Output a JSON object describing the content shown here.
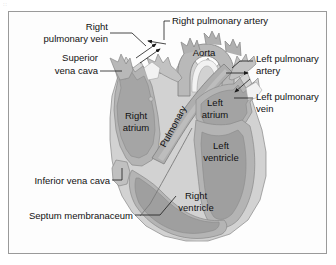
{
  "figure": {
    "corner_tag": "::",
    "frame_color": "#9a9a9a",
    "background_color": "#ffffff"
  },
  "palette": {
    "outer_myocardium": "#d2d2d2",
    "chamber_wall": "#b4b4b4",
    "chamber_lumen": "#a0a0a0",
    "vessel_light": "#c9c9c9",
    "vessel_dark": "#9c9c9c",
    "lumen_white": "#f2f2f2",
    "outline": "#6e6e6e",
    "label_text": "#111111",
    "leader_line": "#1a1a1a"
  },
  "labels": [
    {
      "id": "right-pulmonary-vein",
      "text_lines": [
        "Right",
        "pulmonary vein"
      ],
      "anchor": "end",
      "x": 108,
      "y": 36,
      "line_height": 12
    },
    {
      "id": "right-pulmonary-artery",
      "text_lines": [
        "Right pulmonary artery"
      ],
      "anchor": "start",
      "x": 172,
      "y": 24,
      "line_height": 12
    },
    {
      "id": "superior-vena-cava",
      "text_lines": [
        "Superior",
        "vena cava"
      ],
      "anchor": "end",
      "x": 98,
      "y": 67,
      "line_height": 12
    },
    {
      "id": "aorta",
      "text_lines": [
        "Aorta"
      ],
      "anchor": "middle",
      "x": 201,
      "y": 55,
      "line_height": 12
    },
    {
      "id": "left-pulmonary-artery",
      "text_lines": [
        "Left pulmonary",
        "artery"
      ],
      "anchor": "start",
      "x": 255,
      "y": 64,
      "line_height": 12
    },
    {
      "id": "left-pulmonary-vein",
      "text_lines": [
        "Left pulmonary",
        "vein"
      ],
      "anchor": "start",
      "x": 255,
      "y": 101,
      "line_height": 12
    },
    {
      "id": "left-atrium",
      "text_lines": [
        "Left",
        "atrium"
      ],
      "anchor": "middle",
      "x": 211,
      "y": 106,
      "line_height": 12
    },
    {
      "id": "right-atrium",
      "text_lines": [
        "Right",
        "atrium"
      ],
      "anchor": "middle",
      "x": 127,
      "y": 119,
      "line_height": 12
    },
    {
      "id": "pulmonary",
      "text_lines": [
        "Pulmonary"
      ],
      "anchor": "middle",
      "x": 174,
      "y": 124,
      "rotation": -62,
      "line_height": 12
    },
    {
      "id": "left-ventricle",
      "text_lines": [
        "Left",
        "ventricle"
      ],
      "anchor": "middle",
      "x": 215,
      "y": 147,
      "line_height": 12
    },
    {
      "id": "inferior-vena-cava",
      "text_lines": [
        "Inferior vena cava"
      ],
      "anchor": "end",
      "x": 110,
      "y": 183,
      "line_height": 12
    },
    {
      "id": "right-ventricle",
      "text_lines": [
        "Right",
        "ventricle"
      ],
      "anchor": "middle",
      "x": 196,
      "y": 199,
      "line_height": 12
    },
    {
      "id": "septum-membranaceum",
      "text_lines": [
        "Septum membranaceum"
      ],
      "anchor": "end",
      "x": 133,
      "y": 218,
      "line_height": 12
    }
  ],
  "structures": [
    {
      "id": "right-atrium",
      "name": "Right atrium"
    },
    {
      "id": "left-atrium",
      "name": "Left atrium"
    },
    {
      "id": "right-ventricle",
      "name": "Right ventricle"
    },
    {
      "id": "left-ventricle",
      "name": "Left ventricle"
    },
    {
      "id": "aorta",
      "name": "Aorta"
    },
    {
      "id": "pulmonary-trunk",
      "name": "Pulmonary"
    },
    {
      "id": "superior-vena-cava",
      "name": "Superior vena cava"
    },
    {
      "id": "inferior-vena-cava",
      "name": "Inferior vena cava"
    },
    {
      "id": "right-pulmonary-artery",
      "name": "Right pulmonary artery"
    },
    {
      "id": "left-pulmonary-artery",
      "name": "Left pulmonary artery"
    },
    {
      "id": "right-pulmonary-vein",
      "name": "Right pulmonary vein"
    },
    {
      "id": "left-pulmonary-vein",
      "name": "Left pulmonary vein"
    },
    {
      "id": "septum-membranaceum",
      "name": "Septum membranaceum"
    }
  ]
}
